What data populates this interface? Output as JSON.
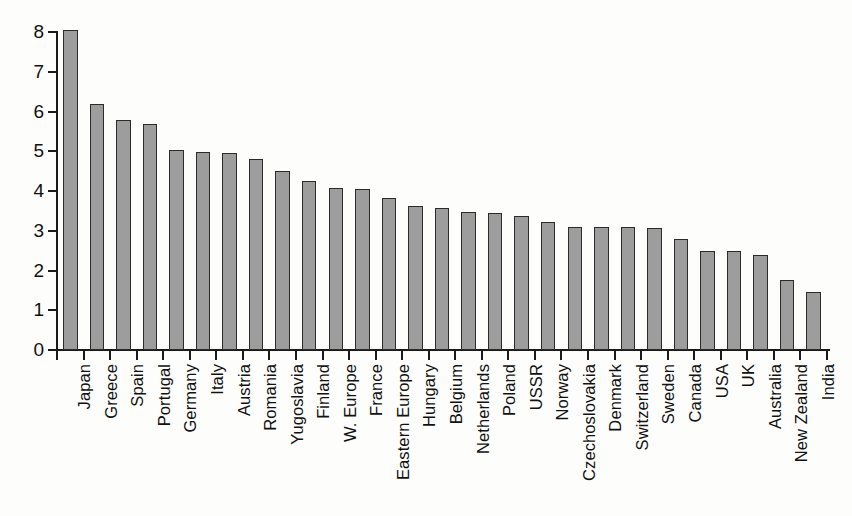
{
  "chart_data": {
    "type": "bar",
    "title": "",
    "subtitle": "",
    "xlabel": "",
    "ylabel": "",
    "ylim": [
      0,
      8
    ],
    "yticks": [
      0,
      1,
      2,
      3,
      4,
      5,
      6,
      7,
      8
    ],
    "ytick_labels": [
      "0",
      "1",
      "2",
      "3",
      "4",
      "5",
      "6",
      "7",
      "8"
    ],
    "grid": false,
    "legend": null,
    "legend_position": "none",
    "orientation": "vertical",
    "bar_fill_color": "#9d9d9d",
    "bar_edge_color": "#2b2b2b",
    "background_color": "#fdfdfb",
    "categories": [
      "Japan",
      "Greece",
      "Spain",
      "Portugal",
      "Germany",
      "Italy",
      "Austria",
      "Romania",
      "Yugoslavia",
      "Finland",
      "W. Europe",
      "France",
      "Eastern Europe",
      "Hungary",
      "Belgium",
      "Netherlands",
      "Poland",
      "USSR",
      "Norway",
      "Czechoslovakia",
      "Denmark",
      "Switzerland",
      "Sweden",
      "Canada",
      "USA",
      "UK",
      "Australia",
      "New Zealand",
      "India"
    ],
    "values": [
      8.05,
      6.2,
      5.78,
      5.68,
      5.03,
      4.97,
      4.95,
      4.8,
      4.5,
      4.25,
      4.08,
      4.05,
      3.82,
      3.62,
      3.58,
      3.48,
      3.45,
      3.38,
      3.22,
      3.1,
      3.1,
      3.1,
      3.08,
      2.78,
      2.5,
      2.48,
      2.38,
      1.75,
      1.45
    ]
  }
}
